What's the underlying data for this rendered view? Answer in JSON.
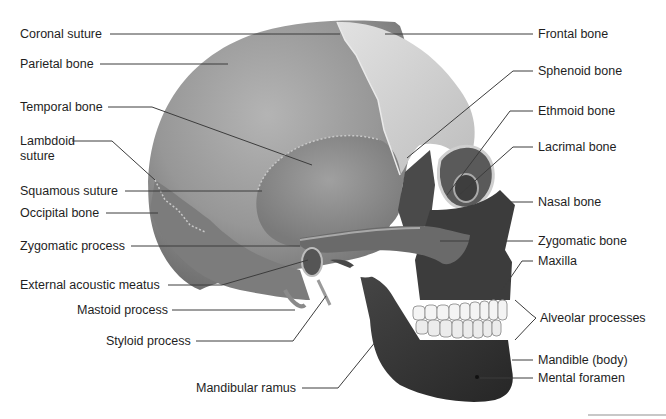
{
  "diagram": {
    "left_labels": [
      {
        "id": "coronal-suture",
        "text": "Coronal suture",
        "x": 20,
        "y": 27
      },
      {
        "id": "parietal-bone",
        "text": "Parietal bone",
        "x": 20,
        "y": 57
      },
      {
        "id": "temporal-bone",
        "text": "Temporal bone",
        "x": 20,
        "y": 100
      },
      {
        "id": "lambdoid-suture-1",
        "text": "Lambdoid",
        "x": 20,
        "y": 134
      },
      {
        "id": "lambdoid-suture-2",
        "text": "suture",
        "x": 20,
        "y": 149
      },
      {
        "id": "squamous-suture",
        "text": "Squamous suture",
        "x": 20,
        "y": 184
      },
      {
        "id": "occipital-bone",
        "text": "Occipital bone",
        "x": 20,
        "y": 206
      },
      {
        "id": "zygomatic-process",
        "text": "Zygomatic process",
        "x": 20,
        "y": 239
      },
      {
        "id": "external-acoustic-meatus",
        "text": "External acoustic meatus",
        "x": 20,
        "y": 278
      },
      {
        "id": "mastoid-process",
        "text": "Mastoid process",
        "x": 77,
        "y": 303
      },
      {
        "id": "styloid-process",
        "text": "Styloid process",
        "x": 106,
        "y": 334
      },
      {
        "id": "mandibular-ramus",
        "text": "Mandibular ramus",
        "x": 196,
        "y": 381
      }
    ],
    "right_labels": [
      {
        "id": "frontal-bone",
        "text": "Frontal bone",
        "x": 538,
        "y": 27
      },
      {
        "id": "sphenoid-bone",
        "text": "Sphenoid bone",
        "x": 538,
        "y": 64
      },
      {
        "id": "ethmoid-bone",
        "text": "Ethmoid bone",
        "x": 538,
        "y": 104
      },
      {
        "id": "lacrimal-bone",
        "text": "Lacrimal bone",
        "x": 538,
        "y": 140
      },
      {
        "id": "nasal-bone",
        "text": "Nasal bone",
        "x": 538,
        "y": 195
      },
      {
        "id": "zygomatic-bone",
        "text": "Zygomatic bone",
        "x": 538,
        "y": 234
      },
      {
        "id": "maxilla",
        "text": "Maxilla",
        "x": 538,
        "y": 254
      },
      {
        "id": "alveolar-processes",
        "text": "Alveolar processes",
        "x": 540,
        "y": 311
      },
      {
        "id": "mandible-body",
        "text": "Mandible (body)",
        "x": 538,
        "y": 353
      },
      {
        "id": "mental-foramen",
        "text": "Mental foramen",
        "x": 538,
        "y": 371
      }
    ],
    "colors": {
      "parietal": "#9a9a9a",
      "frontal": "#d8d8d8",
      "temporal": "#8c8c8c",
      "occipital": "#7e7e7e",
      "sphenoid": "#4a4a4a",
      "face_dark": "#3a3a3a",
      "mandible": "#333333",
      "teeth": "#f4f4f4",
      "leader_line": "#3c3c3c",
      "text": "#1e1e1e"
    }
  }
}
